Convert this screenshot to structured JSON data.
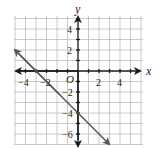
{
  "figure": {
    "type": "coordinate-graph",
    "axes": {
      "x_label": "x",
      "y_label": "y",
      "origin_label": "O",
      "x_tick_labels": [
        "−4",
        "−2",
        "2",
        "4"
      ],
      "y_tick_labels": [
        "4",
        "2",
        "−2",
        "−4",
        "−6"
      ],
      "x_range": [
        -6,
        6
      ],
      "y_range": [
        -7,
        5
      ],
      "grid": true,
      "grid_step": 1
    },
    "line": {
      "equation": "y = -x - 4",
      "slope": -1,
      "y_intercept": -4,
      "x_intercept": -4,
      "arrows": "both",
      "color": "#555555"
    },
    "colors": {
      "grid": "#bdbdbd",
      "axes": "#1a1a1a",
      "line": "#555555"
    }
  }
}
